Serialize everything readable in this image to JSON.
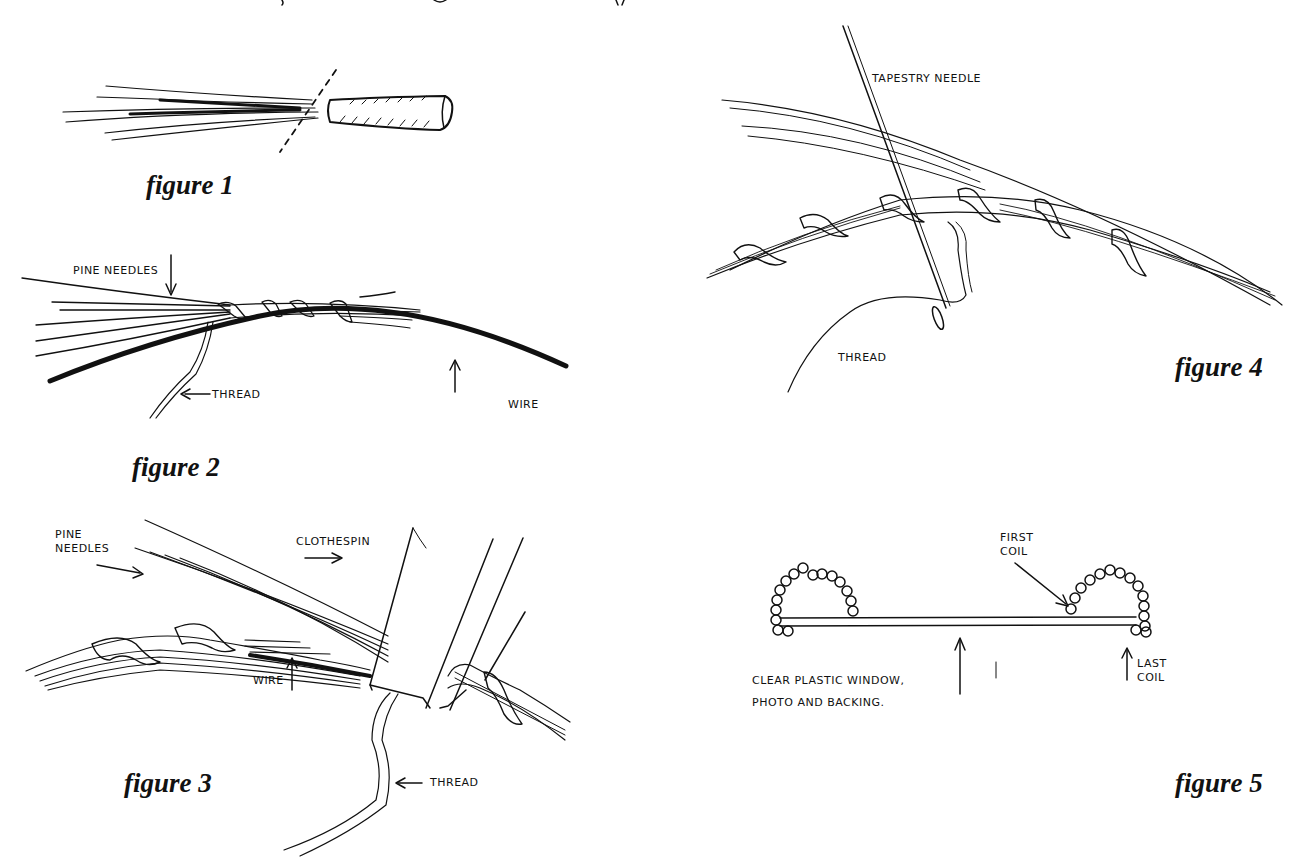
{
  "page": {
    "background": "#ffffff",
    "ink_color": "#111111"
  },
  "figures": [
    {
      "id": "figure-1",
      "caption": "figure 1",
      "labels": []
    },
    {
      "id": "figure-2",
      "caption": "figure 2",
      "labels": [
        "PINE NEEDLES",
        "THREAD",
        "WIRE"
      ]
    },
    {
      "id": "figure-3",
      "caption": "figure 3",
      "labels": [
        "PINE\nNEEDLES",
        "CLOTHESPIN",
        "WIRE",
        "THREAD"
      ]
    },
    {
      "id": "figure-4",
      "caption": "figure 4",
      "labels": [
        "TAPESTRY NEEDLE",
        "THREAD"
      ]
    },
    {
      "id": "figure-5",
      "caption": "figure 5",
      "labels": [
        "FIRST\nCOIL",
        "CLEAR PLASTIC WINDOW,\nPHOTO AND BACKING.",
        "LAST\nCOIL"
      ]
    }
  ]
}
